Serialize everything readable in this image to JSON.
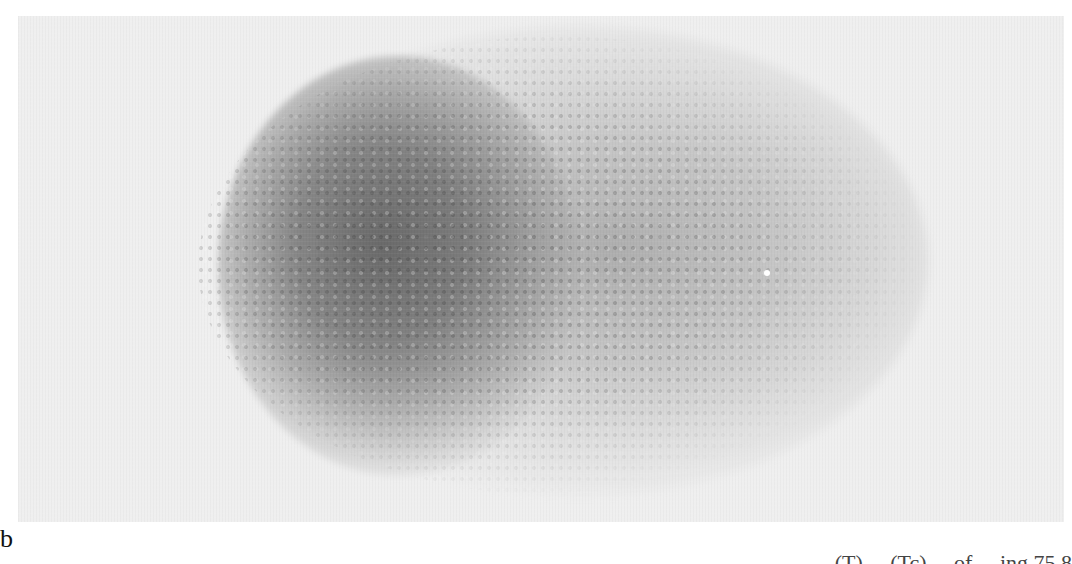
{
  "figure": {
    "panel_label": "b",
    "image_description": "Grayscale scintigraphic image showing a dense dark speckled lobe on the left and a fainter, broader speckled lobe extending to the right on a light gray background",
    "colors": {
      "background": "#efefef",
      "dense_region": "#5a5a5a",
      "faint_region": "#9a9a9a"
    }
  },
  "caption": {
    "visible_fragment": "(T) ... (Tc) ... of ... ing 75.8",
    "note": "Caption text is clipped at the bottom edge; only the upper portions of glyphs are visible"
  }
}
